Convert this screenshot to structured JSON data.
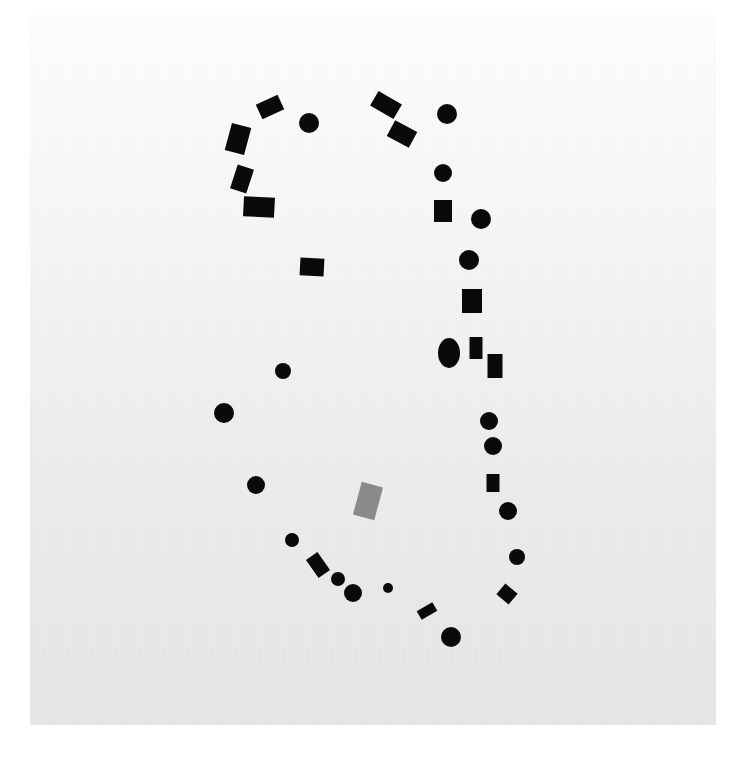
{
  "artwork": {
    "background": {
      "paper_top_color": "#fdfdfd",
      "paper_bottom_color": "#e6e6e6"
    },
    "ink_color": "#0a0a0a",
    "accent_color": "#8a8a8a",
    "shapes": [
      {
        "type": "rect",
        "cx": 270,
        "cy": 107,
        "w": 24,
        "h": 16,
        "rot": -25
      },
      {
        "type": "circle",
        "cx": 309,
        "cy": 123,
        "r": 10
      },
      {
        "type": "rect",
        "cx": 238,
        "cy": 139,
        "w": 20,
        "h": 28,
        "rot": 15
      },
      {
        "type": "rect",
        "cx": 242,
        "cy": 179,
        "w": 17,
        "h": 25,
        "rot": 18
      },
      {
        "type": "rect",
        "cx": 259,
        "cy": 207,
        "w": 31,
        "h": 20,
        "rot": 3
      },
      {
        "type": "rect",
        "cx": 386,
        "cy": 105,
        "w": 27,
        "h": 17,
        "rot": 30
      },
      {
        "type": "rect",
        "cx": 402,
        "cy": 134,
        "w": 25,
        "h": 18,
        "rot": 28
      },
      {
        "type": "circle",
        "cx": 447,
        "cy": 114,
        "r": 10
      },
      {
        "type": "circle",
        "cx": 443,
        "cy": 173,
        "r": 9
      },
      {
        "type": "rect",
        "cx": 443,
        "cy": 211,
        "w": 18,
        "h": 22,
        "rot": 0
      },
      {
        "type": "circle",
        "cx": 481,
        "cy": 219,
        "r": 10
      },
      {
        "type": "rect",
        "cx": 312,
        "cy": 267,
        "w": 24,
        "h": 18,
        "rot": 3
      },
      {
        "type": "circle",
        "cx": 469,
        "cy": 260,
        "r": 10
      },
      {
        "type": "rect",
        "cx": 472,
        "cy": 301,
        "w": 20,
        "h": 24,
        "rot": 0
      },
      {
        "type": "ellipse",
        "cx": 449,
        "cy": 353,
        "rx": 11,
        "ry": 15
      },
      {
        "type": "rect",
        "cx": 476,
        "cy": 348,
        "w": 13,
        "h": 22,
        "rot": 0
      },
      {
        "type": "rect",
        "cx": 495,
        "cy": 366,
        "w": 15,
        "h": 24,
        "rot": 0
      },
      {
        "type": "circle",
        "cx": 283,
        "cy": 371,
        "r": 8
      },
      {
        "type": "circle",
        "cx": 224,
        "cy": 413,
        "r": 10
      },
      {
        "type": "circle",
        "cx": 489,
        "cy": 421,
        "r": 9
      },
      {
        "type": "circle",
        "cx": 493,
        "cy": 446,
        "r": 9
      },
      {
        "type": "rect",
        "cx": 493,
        "cy": 483,
        "w": 13,
        "h": 18,
        "rot": 0
      },
      {
        "type": "circle",
        "cx": 256,
        "cy": 485,
        "r": 9
      },
      {
        "type": "rect",
        "cx": 368,
        "cy": 501,
        "w": 22,
        "h": 34,
        "rot": 15,
        "accent": true
      },
      {
        "type": "circle",
        "cx": 508,
        "cy": 511,
        "r": 9
      },
      {
        "type": "circle",
        "cx": 292,
        "cy": 540,
        "r": 7
      },
      {
        "type": "circle",
        "cx": 517,
        "cy": 557,
        "r": 8
      },
      {
        "type": "rect",
        "cx": 318,
        "cy": 565,
        "w": 14,
        "h": 22,
        "rot": -35
      },
      {
        "type": "circle",
        "cx": 338,
        "cy": 579,
        "r": 7
      },
      {
        "type": "circle",
        "cx": 388,
        "cy": 588,
        "r": 5
      },
      {
        "type": "circle",
        "cx": 353,
        "cy": 593,
        "r": 9
      },
      {
        "type": "rect",
        "cx": 507,
        "cy": 594,
        "w": 16,
        "h": 14,
        "rot": 40
      },
      {
        "type": "rect",
        "cx": 427,
        "cy": 611,
        "w": 18,
        "h": 10,
        "rot": -30
      },
      {
        "type": "circle",
        "cx": 451,
        "cy": 637,
        "r": 10
      }
    ]
  }
}
